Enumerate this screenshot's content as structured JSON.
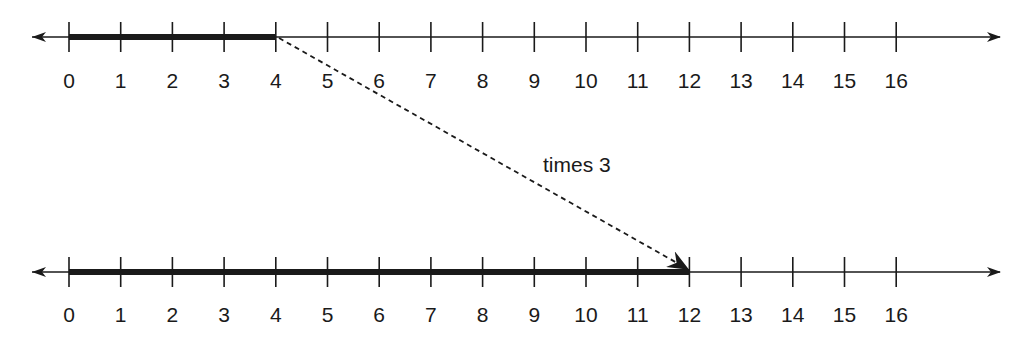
{
  "diagram": {
    "top_line": {
      "ticks": [
        "0",
        "1",
        "2",
        "3",
        "4",
        "5",
        "6",
        "7",
        "8",
        "9",
        "10",
        "11",
        "12",
        "13",
        "14",
        "15",
        "16"
      ],
      "highlight_from": 0,
      "highlight_to": 4
    },
    "bottom_line": {
      "ticks": [
        "0",
        "1",
        "2",
        "3",
        "4",
        "5",
        "6",
        "7",
        "8",
        "9",
        "10",
        "11",
        "12",
        "13",
        "14",
        "15",
        "16"
      ],
      "highlight_from": 0,
      "highlight_to": 12
    },
    "arrow_label": "times 3",
    "colors": {
      "line": "#1a1a1a",
      "background": "#ffffff"
    }
  }
}
